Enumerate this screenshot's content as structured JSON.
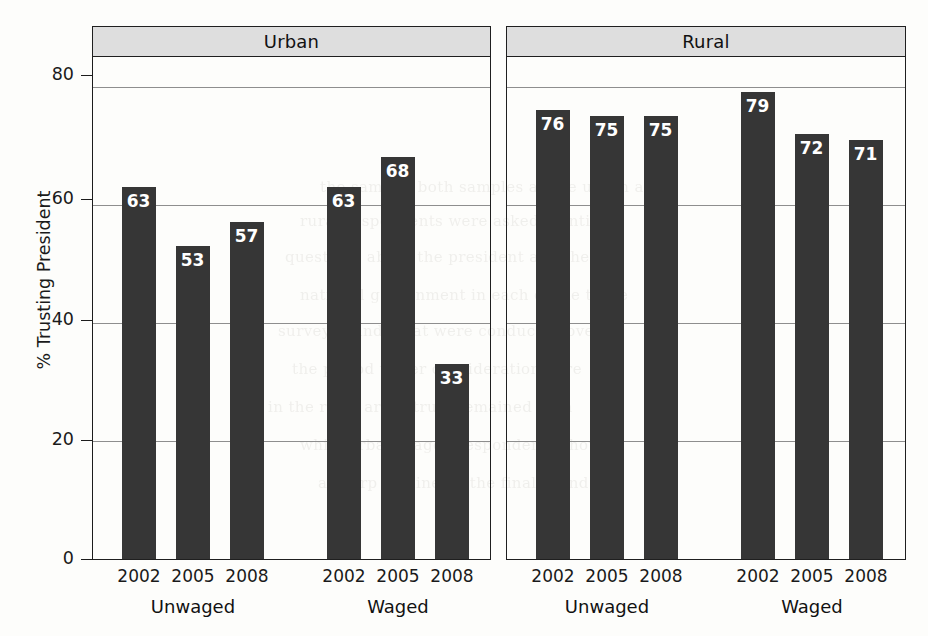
{
  "chart_data": {
    "type": "bar",
    "title": "",
    "xlabel": "",
    "ylabel": "% Trusting President",
    "ylim": [
      0,
      85
    ],
    "y_ticks": [
      0,
      20,
      40,
      60,
      80
    ],
    "y_tick_labels": [
      "0",
      "20",
      "40",
      "60",
      "80"
    ],
    "grid": true,
    "legend": "none",
    "panel_variable": "Residence",
    "group_variable": "Employment",
    "categories": [
      "2002",
      "2005",
      "2008"
    ],
    "panels": [
      {
        "strip_label": "Urban",
        "groups": [
          {
            "label": "Unwaged",
            "categories": [
              "2002",
              "2005",
              "2008"
            ],
            "values": [
              63,
              53,
              57
            ]
          },
          {
            "label": "Waged",
            "categories": [
              "2002",
              "2005",
              "2008"
            ],
            "values": [
              63,
              68,
              33
            ]
          }
        ]
      },
      {
        "strip_label": "Rural",
        "groups": [
          {
            "label": "Unwaged",
            "categories": [
              "2002",
              "2005",
              "2008"
            ],
            "values": [
              76,
              75,
              75
            ]
          },
          {
            "label": "Waged",
            "categories": [
              "2002",
              "2005",
              "2008"
            ],
            "values": [
              79,
              72,
              71
            ]
          }
        ]
      }
    ],
    "colors": {
      "bar": "#363636",
      "bar_label": "#ffffff",
      "strip_background": "#dedede",
      "panel_border": "#1f1f1f",
      "gridline": "#8e8e8e",
      "page_background": "#fdfdfb"
    }
  },
  "bleed_through_text": [
    "the same in both samples as the urban and",
    "rural respondents were asked identical",
    "questions about the president and the",
    "national government in each of the three",
    "survey rounds that were conducted over",
    "the period under consideration here",
    "in the rural areas trust remained high",
    "while urban waged respondents showed",
    "a sharp decline by the final round"
  ]
}
